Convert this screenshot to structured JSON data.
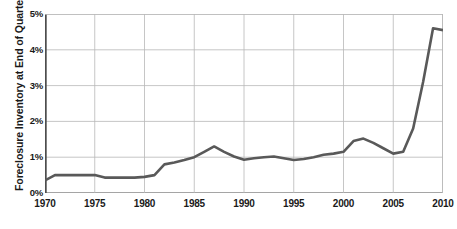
{
  "chart_data": {
    "type": "line",
    "title": "",
    "xlabel": "",
    "ylabel": "Foreclosure Inventory at End of Quarter",
    "xlim": [
      1970,
      2010
    ],
    "ylim": [
      0,
      5
    ],
    "grid": true,
    "legend": null,
    "y_tick_labels": [
      "5%",
      "4%",
      "3%",
      "2%",
      "1%",
      "0%"
    ],
    "y_tick_values": [
      5,
      4,
      3,
      2,
      1,
      0
    ],
    "x_tick_labels": [
      "1970",
      "1975",
      "1980",
      "1985",
      "1990",
      "1995",
      "2000",
      "2005",
      "2010"
    ],
    "x_tick_values": [
      1970,
      1975,
      1980,
      1985,
      1990,
      1995,
      2000,
      2005,
      2010
    ],
    "series": [
      {
        "name": "Foreclosure Inventory",
        "color": "#595959",
        "x": [
          1970,
          1971,
          1972,
          1973,
          1974,
          1975,
          1976,
          1977,
          1978,
          1979,
          1980,
          1981,
          1982,
          1983,
          1984,
          1985,
          1986,
          1987,
          1988,
          1989,
          1990,
          1991,
          1992,
          1993,
          1994,
          1995,
          1996,
          1997,
          1998,
          1999,
          2000,
          2001,
          2002,
          2003,
          2004,
          2005,
          2006,
          2007,
          2008,
          2009,
          2010
        ],
        "values": [
          0.35,
          0.5,
          0.5,
          0.5,
          0.5,
          0.5,
          0.43,
          0.43,
          0.43,
          0.43,
          0.45,
          0.5,
          0.8,
          0.85,
          0.92,
          1.0,
          1.15,
          1.3,
          1.15,
          1.02,
          0.93,
          0.97,
          1.0,
          1.02,
          0.97,
          0.92,
          0.95,
          1.0,
          1.07,
          1.1,
          1.15,
          1.45,
          1.52,
          1.4,
          1.25,
          1.1,
          1.15,
          1.8,
          3.1,
          4.6,
          4.55
        ]
      }
    ]
  },
  "axes": {
    "y_title": "Foreclosure Inventory at End of Quarter"
  },
  "colors": {
    "line": "#595959",
    "grid": "#b8b8b8",
    "axis": "#4d4d4d",
    "text": "#1a1a1a",
    "background": "#ffffff"
  }
}
